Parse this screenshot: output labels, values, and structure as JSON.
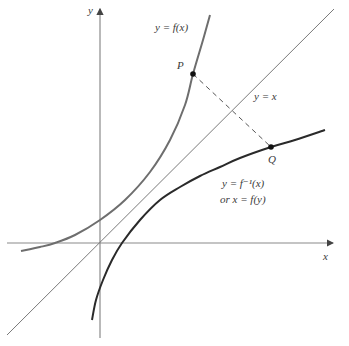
{
  "diagram": {
    "axes": {
      "x_label": "x",
      "y_label": "y",
      "origin": [
        100,
        243
      ],
      "x_axis": {
        "from": [
          7,
          243
        ],
        "to": [
          333,
          243
        ]
      },
      "y_axis": {
        "from": [
          100,
          338
        ],
        "to": [
          100,
          9
        ]
      }
    },
    "line_y_eq_x": {
      "label": "y = x",
      "from": [
        7,
        335
      ],
      "to": [
        334,
        9
      ],
      "color": "#7a7a7a"
    },
    "curves": [
      {
        "name": "f",
        "label": "y = f(x)",
        "color": "#6e6e6e",
        "points": [
          [
            21,
            251
          ],
          [
            40,
            247
          ],
          [
            55,
            243
          ],
          [
            75,
            235
          ],
          [
            100,
            220
          ],
          [
            125,
            200
          ],
          [
            150,
            172
          ],
          [
            170,
            140
          ],
          [
            185,
            105
          ],
          [
            193,
            74
          ],
          [
            203,
            40
          ],
          [
            210,
            15
          ]
        ]
      },
      {
        "name": "f_inverse",
        "label_line1": "y = f⁻¹(x)",
        "label_line2": "or x = f(y)",
        "color": "#2a2a2a",
        "points": [
          [
            92,
            320
          ],
          [
            96,
            300
          ],
          [
            103,
            280
          ],
          [
            112,
            260
          ],
          [
            122,
            243
          ],
          [
            140,
            220
          ],
          [
            160,
            200
          ],
          [
            180,
            187
          ],
          [
            200,
            176
          ],
          [
            220,
            167
          ],
          [
            240,
            158
          ],
          [
            271,
            147
          ],
          [
            295,
            140
          ],
          [
            325,
            130
          ]
        ]
      }
    ],
    "points": [
      {
        "name": "P",
        "label": "P",
        "at": [
          193,
          74
        ]
      },
      {
        "name": "Q",
        "label": "Q",
        "at": [
          271,
          147
        ]
      }
    ],
    "segment_PQ": {
      "style": "dashed",
      "from": [
        193,
        74
      ],
      "to": [
        271,
        147
      ]
    },
    "labels": {
      "y_axis": "y",
      "x_axis": "x",
      "f_curve": "y = f(x)",
      "identity_line": "y = x",
      "inverse_line1": "y = f⁻¹(x)",
      "inverse_line2": "or x = f(y)",
      "point_P": "P",
      "point_Q": "Q"
    }
  }
}
